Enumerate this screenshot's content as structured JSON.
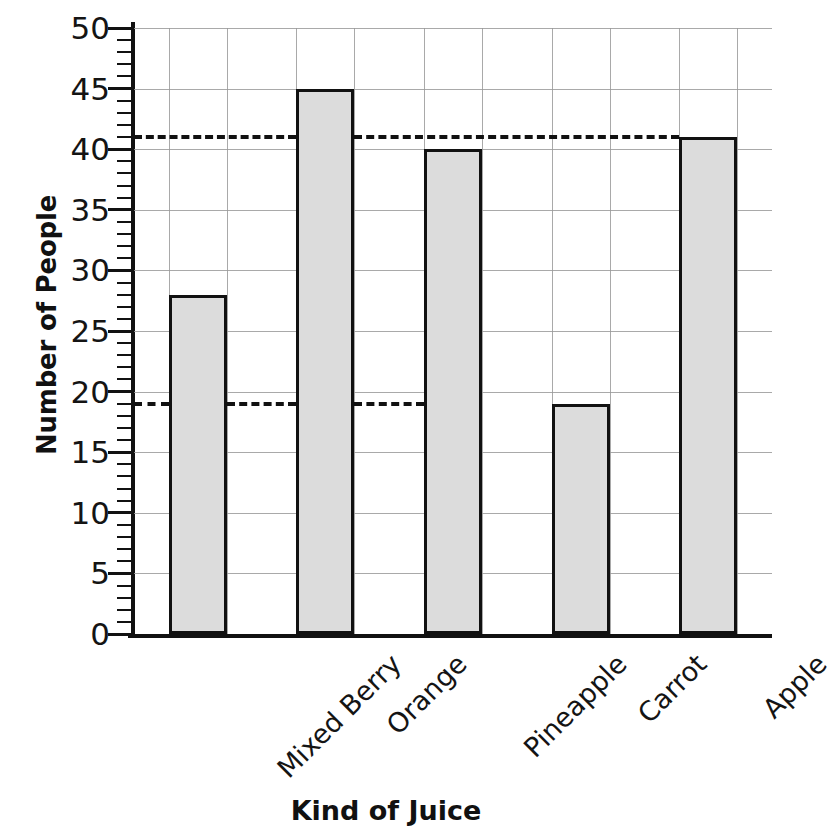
{
  "chart_data": {
    "type": "bar",
    "title": "",
    "xlabel": "Kind of Juice",
    "ylabel": "Number of People",
    "categories": [
      "Mixed Berry",
      "Orange",
      "Pineapple",
      "Carrot",
      "Apple"
    ],
    "values": [
      28,
      45,
      40,
      19,
      41
    ],
    "ylim": [
      0,
      50
    ],
    "y_major_step": 5,
    "y_minor_step": 1,
    "y_ticks": [
      0,
      5,
      10,
      15,
      20,
      25,
      30,
      35,
      40,
      45,
      50
    ],
    "y_tick_labels": [
      "0",
      "5",
      "10",
      "15",
      "20",
      "25",
      "30",
      "35",
      "40",
      "45",
      "50"
    ],
    "grid": true,
    "legend": "none",
    "bar_fill_color": "#dcdcdc",
    "bar_edge_color": "#111111",
    "gridline_color": "#9a9a9a",
    "reference_lines": [
      {
        "value": 41,
        "style": "dashed",
        "label": "",
        "spans_to_category": "Apple"
      },
      {
        "value": 19,
        "style": "dashed",
        "label": "",
        "spans_to_category": "Carrot"
      }
    ],
    "xtick_label_rotation": -45
  }
}
